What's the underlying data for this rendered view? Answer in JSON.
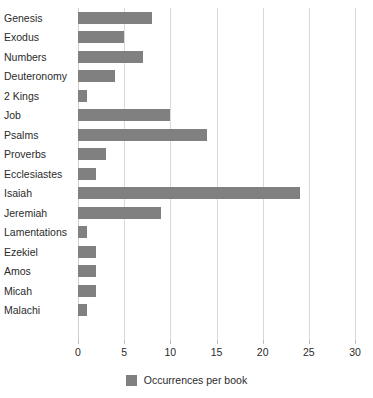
{
  "chart_data": {
    "type": "bar",
    "orientation": "horizontal",
    "title": "",
    "xlabel": "",
    "ylabel": "",
    "xlim": [
      0,
      30
    ],
    "xticks": [
      0,
      5,
      10,
      15,
      20,
      25,
      30
    ],
    "grid": true,
    "legend_position": "bottom-center",
    "bar_color": "#808080",
    "gridline_color": "#d9d9d9",
    "text_color": "#2b2b2b",
    "categories": [
      "Genesis",
      "Exodus",
      "Numbers",
      "Deuteronomy",
      "2 Kings",
      "Job",
      "Psalms",
      "Proverbs",
      "Ecclesiastes",
      "Isaiah",
      "Jeremiah",
      "Lamentations",
      "Ezekiel",
      "Amos",
      "Micah",
      "Malachi"
    ],
    "series": [
      {
        "name": "Occurrences per book",
        "values": [
          8,
          5,
          7,
          4,
          1,
          10,
          14,
          3,
          2,
          24,
          9,
          1,
          2,
          2,
          2,
          1
        ]
      }
    ]
  },
  "legend": {
    "entries": [
      {
        "label": "Occurrences per book",
        "color": "#808080"
      }
    ]
  }
}
